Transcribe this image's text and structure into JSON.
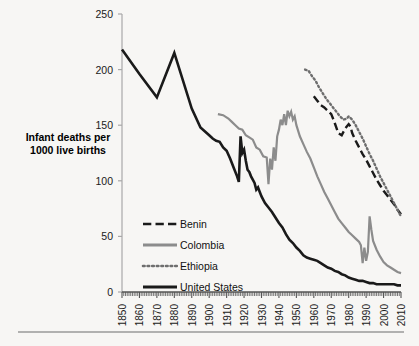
{
  "chart_data": {
    "type": "line",
    "title": "",
    "xlabel": "",
    "ylabel": "Infant deaths per 1000 live births",
    "ylabel_line1": "Infant deaths per",
    "ylabel_line2": "1000 live births",
    "xlim": [
      1850,
      2010
    ],
    "ylim": [
      0,
      250
    ],
    "yticks": [
      0,
      50,
      100,
      150,
      200,
      250
    ],
    "xticks": [
      1850,
      1860,
      1870,
      1880,
      1890,
      1900,
      1910,
      1920,
      1930,
      1940,
      1950,
      1960,
      1970,
      1980,
      1990,
      2000,
      2010
    ],
    "grid": false,
    "legend_position": "lower-left-inside",
    "series": [
      {
        "name": "Benin",
        "color": "#1a1a1a",
        "style": "dashed",
        "width": 2.4,
        "points": [
          [
            1960,
            176
          ],
          [
            1962,
            172
          ],
          [
            1964,
            168
          ],
          [
            1966,
            166
          ],
          [
            1968,
            163
          ],
          [
            1970,
            160
          ],
          [
            1972,
            152
          ],
          [
            1974,
            143
          ],
          [
            1976,
            141
          ],
          [
            1978,
            147
          ],
          [
            1980,
            151
          ],
          [
            1981,
            149
          ],
          [
            1982,
            143
          ],
          [
            1984,
            136
          ],
          [
            1986,
            130
          ],
          [
            1988,
            124
          ],
          [
            1990,
            119
          ],
          [
            1992,
            113
          ],
          [
            1994,
            107
          ],
          [
            1996,
            101
          ],
          [
            1998,
            96
          ],
          [
            2000,
            91
          ],
          [
            2002,
            87
          ],
          [
            2004,
            83
          ],
          [
            2006,
            79
          ],
          [
            2008,
            74
          ],
          [
            2010,
            70
          ]
        ]
      },
      {
        "name": "Colombia",
        "color": "#8c8c8c",
        "style": "solid",
        "width": 2.2,
        "points": [
          [
            1905,
            160
          ],
          [
            1908,
            159
          ],
          [
            1911,
            156
          ],
          [
            1913,
            153
          ],
          [
            1915,
            150
          ],
          [
            1917,
            147
          ],
          [
            1919,
            146
          ],
          [
            1921,
            141
          ],
          [
            1923,
            139
          ],
          [
            1925,
            137
          ],
          [
            1927,
            130
          ],
          [
            1929,
            128
          ],
          [
            1931,
            122
          ],
          [
            1933,
            121
          ],
          [
            1934,
            97
          ],
          [
            1935,
            120
          ],
          [
            1936,
            110
          ],
          [
            1937,
            130
          ],
          [
            1938,
            118
          ],
          [
            1939,
            140
          ],
          [
            1940,
            146
          ],
          [
            1941,
            155
          ],
          [
            1942,
            150
          ],
          [
            1943,
            160
          ],
          [
            1944,
            150
          ],
          [
            1945,
            163
          ],
          [
            1946,
            158
          ],
          [
            1947,
            162
          ],
          [
            1948,
            155
          ],
          [
            1949,
            158
          ],
          [
            1950,
            150
          ],
          [
            1952,
            140
          ],
          [
            1954,
            133
          ],
          [
            1956,
            126
          ],
          [
            1958,
            120
          ],
          [
            1960,
            112
          ],
          [
            1962,
            104
          ],
          [
            1964,
            97
          ],
          [
            1966,
            90
          ],
          [
            1968,
            84
          ],
          [
            1970,
            78
          ],
          [
            1972,
            72
          ],
          [
            1974,
            66
          ],
          [
            1976,
            62
          ],
          [
            1978,
            58
          ],
          [
            1980,
            54
          ],
          [
            1982,
            51
          ],
          [
            1984,
            48
          ],
          [
            1986,
            45
          ],
          [
            1987,
            42
          ],
          [
            1988,
            26
          ],
          [
            1989,
            40
          ],
          [
            1990,
            28
          ],
          [
            1991,
            36
          ],
          [
            1992,
            68
          ],
          [
            1993,
            56
          ],
          [
            1994,
            46
          ],
          [
            1996,
            38
          ],
          [
            1998,
            32
          ],
          [
            2000,
            27
          ],
          [
            2002,
            24
          ],
          [
            2004,
            22
          ],
          [
            2006,
            20
          ],
          [
            2008,
            18
          ],
          [
            2010,
            17
          ]
        ]
      },
      {
        "name": "Ethiopia",
        "color": "#6e6e6e",
        "style": "dotted",
        "width": 2.4,
        "points": [
          [
            1955,
            200
          ],
          [
            1957,
            199
          ],
          [
            1959,
            194
          ],
          [
            1961,
            190
          ],
          [
            1963,
            184
          ],
          [
            1965,
            179
          ],
          [
            1967,
            174
          ],
          [
            1969,
            170
          ],
          [
            1971,
            166
          ],
          [
            1973,
            162
          ],
          [
            1975,
            158
          ],
          [
            1977,
            155
          ],
          [
            1979,
            156
          ],
          [
            1980,
            158
          ],
          [
            1982,
            155
          ],
          [
            1984,
            150
          ],
          [
            1986,
            144
          ],
          [
            1988,
            138
          ],
          [
            1990,
            131
          ],
          [
            1992,
            124
          ],
          [
            1994,
            118
          ],
          [
            1996,
            111
          ],
          [
            1998,
            104
          ],
          [
            2000,
            98
          ],
          [
            2002,
            92
          ],
          [
            2004,
            86
          ],
          [
            2006,
            80
          ],
          [
            2008,
            74
          ],
          [
            2010,
            68
          ]
        ]
      },
      {
        "name": "United States",
        "color": "#1a1a1a",
        "style": "solid",
        "width": 2.6,
        "points": [
          [
            1850,
            218
          ],
          [
            1860,
            196
          ],
          [
            1870,
            175
          ],
          [
            1880,
            215
          ],
          [
            1890,
            165
          ],
          [
            1895,
            148
          ],
          [
            1900,
            141
          ],
          [
            1902,
            138
          ],
          [
            1904,
            136
          ],
          [
            1906,
            135
          ],
          [
            1908,
            130
          ],
          [
            1910,
            127
          ],
          [
            1912,
            120
          ],
          [
            1914,
            112
          ],
          [
            1916,
            104
          ],
          [
            1917,
            99
          ],
          [
            1918,
            140
          ],
          [
            1919,
            125
          ],
          [
            1920,
            128
          ],
          [
            1921,
            118
          ],
          [
            1922,
            110
          ],
          [
            1923,
            108
          ],
          [
            1924,
            104
          ],
          [
            1925,
            101
          ],
          [
            1926,
            98
          ],
          [
            1927,
            92
          ],
          [
            1928,
            94
          ],
          [
            1929,
            90
          ],
          [
            1930,
            86
          ],
          [
            1932,
            80
          ],
          [
            1934,
            76
          ],
          [
            1936,
            72
          ],
          [
            1938,
            67
          ],
          [
            1940,
            62
          ],
          [
            1942,
            58
          ],
          [
            1944,
            52
          ],
          [
            1946,
            47
          ],
          [
            1948,
            44
          ],
          [
            1950,
            40
          ],
          [
            1952,
            37
          ],
          [
            1954,
            33
          ],
          [
            1956,
            31
          ],
          [
            1958,
            30
          ],
          [
            1960,
            29
          ],
          [
            1962,
            28
          ],
          [
            1964,
            26
          ],
          [
            1966,
            24
          ],
          [
            1968,
            22
          ],
          [
            1970,
            21
          ],
          [
            1972,
            19
          ],
          [
            1974,
            18
          ],
          [
            1976,
            16
          ],
          [
            1978,
            15
          ],
          [
            1980,
            13
          ],
          [
            1982,
            12
          ],
          [
            1984,
            11
          ],
          [
            1986,
            10
          ],
          [
            1988,
            10
          ],
          [
            1990,
            9
          ],
          [
            1992,
            8
          ],
          [
            1994,
            8
          ],
          [
            1996,
            7
          ],
          [
            1998,
            7
          ],
          [
            2000,
            7
          ],
          [
            2002,
            7
          ],
          [
            2004,
            7
          ],
          [
            2006,
            7
          ],
          [
            2008,
            6
          ],
          [
            2010,
            6
          ]
        ]
      }
    ],
    "legend": [
      {
        "label": "Benin",
        "color": "#1a1a1a",
        "style": "dashed"
      },
      {
        "label": "Colombia",
        "color": "#8c8c8c",
        "style": "solid"
      },
      {
        "label": "Ethiopia",
        "color": "#6e6e6e",
        "style": "dotted"
      },
      {
        "label": "United States",
        "color": "#1a1a1a",
        "style": "solid"
      }
    ]
  }
}
